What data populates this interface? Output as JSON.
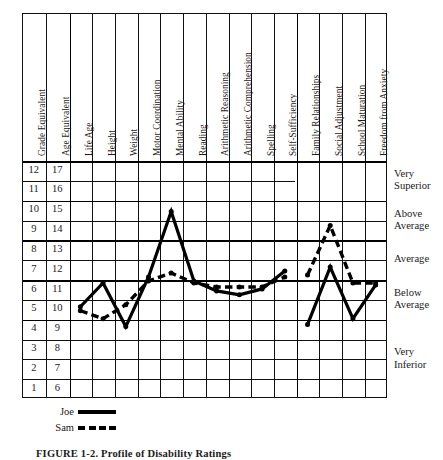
{
  "figure": {
    "caption": "FIGURE 1-2.  Profile of Disability Ratings",
    "frame": {
      "x": 22,
      "y": 13,
      "width": 365,
      "height": 385
    }
  },
  "columns": [
    {
      "key": "grade_equivalent",
      "label": "Grade Equivalent",
      "type": "scale"
    },
    {
      "key": "age_equivalent",
      "label": "Age Equivalent",
      "type": "scale"
    },
    {
      "key": "life_age",
      "label": "Life Age",
      "type": "trait"
    },
    {
      "key": "height",
      "label": "Height",
      "type": "trait"
    },
    {
      "key": "weight",
      "label": "Weight",
      "type": "trait"
    },
    {
      "key": "motor_coordination",
      "label": "Motor Coordination",
      "type": "trait"
    },
    {
      "key": "mental_ability",
      "label": "Mental Ability",
      "type": "trait"
    },
    {
      "key": "reading",
      "label": "Reading",
      "type": "trait"
    },
    {
      "key": "arithmetic_reasoning",
      "label": "Arithmetic Reasoning",
      "type": "trait"
    },
    {
      "key": "arithmetic_comprehension",
      "label": "Arithmetic Comprehension",
      "type": "trait"
    },
    {
      "key": "spelling",
      "label": "Spelling",
      "type": "trait"
    },
    {
      "key": "self_sufficiency",
      "label": "Self-Sufficiency",
      "type": "trait"
    },
    {
      "key": "family_relationships",
      "label": "Family Relationships",
      "type": "trait"
    },
    {
      "key": "social_adjustment",
      "label": "Social Adjustment",
      "type": "trait"
    },
    {
      "key": "school_maturation",
      "label": "School Maturation",
      "type": "trait"
    },
    {
      "key": "freedom_from_anxiety",
      "label": "Freedom from Anxiety",
      "type": "trait"
    }
  ],
  "scale_rows": [
    {
      "grade": "12",
      "age": "17"
    },
    {
      "grade": "11",
      "age": "16"
    },
    {
      "grade": "10",
      "age": "15"
    },
    {
      "grade": "9",
      "age": "14"
    },
    {
      "grade": "8",
      "age": "13"
    },
    {
      "grade": "7",
      "age": "12"
    },
    {
      "grade": "6",
      "age": "11"
    },
    {
      "grade": "5",
      "age": "10"
    },
    {
      "grade": "4",
      "age": "9"
    },
    {
      "grade": "3",
      "age": "8"
    },
    {
      "grade": "2",
      "age": "7"
    },
    {
      "grade": "1",
      "age": "6"
    }
  ],
  "bands": [
    {
      "label": "Very\nSuperior",
      "top_grade": 12,
      "bottom_grade": 11
    },
    {
      "label": "Above\nAverage",
      "top_grade": 10,
      "bottom_grade": 9
    },
    {
      "label": "Average",
      "top_grade": 8,
      "bottom_grade": 7
    },
    {
      "label": "Below\nAverage",
      "top_grade": 6,
      "bottom_grade": 5
    },
    {
      "label": "Very\nInferior",
      "top_grade": 4,
      "bottom_grade": 1
    }
  ],
  "legend": {
    "entries": [
      {
        "name": "Joe",
        "style": "solid",
        "swatch": "solid-line-swatch"
      },
      {
        "name": "Sam",
        "style": "dashed",
        "swatch": "dashed-line-swatch"
      }
    ]
  },
  "chart_data": {
    "type": "line",
    "title": "Profile of Disability Ratings",
    "xlabel": "",
    "ylabel": "Grade Equivalent / Age Equivalent",
    "ylim": [
      1,
      12
    ],
    "grid": true,
    "legend_position": "below-left",
    "categories": [
      "Life Age",
      "Height",
      "Weight",
      "Motor Coordination",
      "Mental Ability",
      "Reading",
      "Arithmetic Reasoning",
      "Arithmetic Comprehension",
      "Spelling",
      "Self-Sufficiency",
      "Family Relationships",
      "Social Adjustment",
      "School Maturation",
      "Freedom from Anxiety"
    ],
    "y_tick_labels_grade": [
      "12",
      "11",
      "10",
      "9",
      "8",
      "7",
      "6",
      "5",
      "4",
      "3",
      "2",
      "1"
    ],
    "y_tick_labels_age": [
      "17",
      "16",
      "15",
      "14",
      "13",
      "12",
      "11",
      "10",
      "9",
      "8",
      "7",
      "6"
    ],
    "series": [
      {
        "name": "Joe",
        "style": "solid",
        "values": [
          5.1,
          6.3,
          4.1,
          6.6,
          9.9,
          6.4,
          5.9,
          5.7,
          6.0,
          6.9,
          null,
          null,
          null,
          null
        ]
      },
      {
        "name": "Joe (social block)",
        "style": "solid",
        "values": [
          null,
          null,
          null,
          null,
          null,
          null,
          null,
          null,
          null,
          null,
          4.2,
          7.1,
          4.5,
          6.2
        ]
      },
      {
        "name": "Sam",
        "style": "dashed",
        "values": [
          4.9,
          4.5,
          5.2,
          6.4,
          6.8,
          6.3,
          6.1,
          6.1,
          6.1,
          6.6,
          null,
          null,
          null,
          null
        ]
      },
      {
        "name": "Sam (social block)",
        "style": "dashed",
        "values": [
          null,
          null,
          null,
          null,
          null,
          null,
          null,
          null,
          null,
          null,
          6.7,
          9.2,
          6.3,
          6.3
        ]
      }
    ],
    "band_annotations": [
      "Very Superior",
      "Above Average",
      "Average",
      "Below Average",
      "Very Inferior"
    ]
  }
}
